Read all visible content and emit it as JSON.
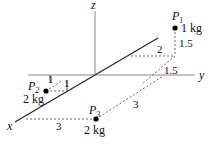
{
  "axes": {
    "x_label": "x",
    "y_label": "y",
    "z_label": "z"
  },
  "points": [
    {
      "id": "P1",
      "name": "P",
      "sub": "1",
      "mass": "1 kg"
    },
    {
      "id": "P2",
      "name": "P",
      "sub": "2",
      "mass": "2 kg"
    },
    {
      "id": "P3",
      "name": "P",
      "sub": "3",
      "mass": "2 kg"
    }
  ],
  "dimensions": {
    "p1_height": "1.5",
    "p1_x_offset": "2",
    "p1_y_offset": "1.5",
    "p2_a": "1",
    "p2_b": "1",
    "p3_x": "3",
    "p3_y": "3"
  },
  "colors": {
    "axis": "#8a8a8a",
    "line": "#222222",
    "dash": "#555555",
    "point": "#000000"
  }
}
